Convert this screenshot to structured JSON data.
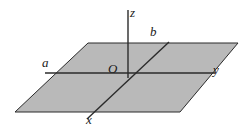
{
  "figure": {
    "kind": "3d-coordinate-plane-diagram",
    "background_color": "#ffffff",
    "plane": {
      "name": "shaded-plane",
      "fill_color": "#b9b9b9",
      "stroke_color": "#2b2b2b",
      "stroke_width": 1,
      "points": "88,43 238,43 180,112 15,112"
    },
    "labels": {
      "z": "z",
      "b": "b",
      "a": "a",
      "O": "O",
      "y": "y",
      "x": "x"
    },
    "lines": {
      "z_axis": {
        "x1": 128,
        "y1": 10,
        "x2": 128,
        "y2": 78,
        "color": "#2b2b2b",
        "width": 1.4
      },
      "a_to_y_axis": {
        "x1": 45,
        "y1": 73,
        "x2": 215,
        "y2": 73,
        "color": "#2b2b2b",
        "width": 1.4
      },
      "b_to_x_axis": {
        "x1": 169,
        "y1": 42,
        "x2": 87,
        "y2": 119,
        "color": "#2b2b2b",
        "width": 1.4
      }
    }
  }
}
